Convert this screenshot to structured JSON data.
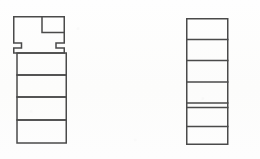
{
  "image": {
    "kind": "scanned-line-drawing",
    "width": 260,
    "height": 159,
    "background_color": "#fdfdfc",
    "stroke_color": "#4a4a4a",
    "stroke_width": 1.5,
    "fill_color": "none",
    "description": "Two outlined stacked-rectangle figures on a blank off-white background"
  },
  "figures": [
    {
      "id": "left-figure",
      "name": "left-stacked-figure",
      "bounds": {
        "x": 13,
        "y": 16,
        "width": 52,
        "height": 127
      },
      "parts": [
        {
          "id": "left-head-block",
          "name": "notched-head-block",
          "outline_points": "13,16 65,16 65,43 56,43 56,48 65,48 65,53 13,53 13,48 21,48 21,43 13,43",
          "notch": {
            "name": "corner-notch",
            "x": 42,
            "y": 16,
            "width": 23,
            "height": 16
          }
        },
        {
          "id": "left-cell-1",
          "name": "stack-cell",
          "x": 15,
          "y": 53,
          "width": 50,
          "height": 22
        },
        {
          "id": "left-cell-2",
          "name": "stack-cell",
          "x": 15,
          "y": 75,
          "width": 50,
          "height": 22
        },
        {
          "id": "left-cell-3",
          "name": "stack-cell",
          "x": 15,
          "y": 97,
          "width": 50,
          "height": 23
        },
        {
          "id": "left-cell-4",
          "name": "stack-cell",
          "x": 15,
          "y": 120,
          "width": 50,
          "height": 23
        }
      ]
    },
    {
      "id": "right-figure",
      "name": "right-ladder-figure",
      "bounds": {
        "x": 186,
        "y": 18,
        "width": 42,
        "height": 127
      },
      "parts": [
        {
          "id": "right-cell-1",
          "name": "ladder-cell",
          "x": 186,
          "y": 18,
          "width": 42,
          "height": 21
        },
        {
          "id": "right-cell-2",
          "name": "ladder-cell",
          "x": 186,
          "y": 39,
          "width": 42,
          "height": 21
        },
        {
          "id": "right-cell-3",
          "name": "ladder-cell",
          "x": 186,
          "y": 60,
          "width": 42,
          "height": 22
        },
        {
          "id": "right-cell-4",
          "name": "ladder-cell",
          "x": 186,
          "y": 82,
          "width": 42,
          "height": 21
        },
        {
          "id": "right-cell-5",
          "name": "ladder-cell-thin",
          "x": 186,
          "y": 103,
          "width": 42,
          "height": 5
        },
        {
          "id": "right-cell-6",
          "name": "ladder-cell",
          "x": 186,
          "y": 108,
          "width": 42,
          "height": 19
        },
        {
          "id": "right-cell-7",
          "name": "ladder-cell",
          "x": 186,
          "y": 127,
          "width": 42,
          "height": 18
        }
      ]
    }
  ],
  "chart_data": {
    "type": "diagram",
    "title": "",
    "subtitle": "",
    "annotations": [],
    "legend": [],
    "shape_counts": {
      "left_figure_cells": 4,
      "left_figure_head_blocks": 1,
      "left_figure_notches": 1,
      "right_figure_cells": 7
    }
  }
}
